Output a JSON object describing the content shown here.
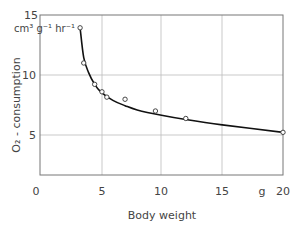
{
  "chart_data": {
    "type": "line",
    "title": "",
    "xlabel": "Body weight",
    "x_unit": "g",
    "ylabel": "O2 - consumption",
    "y_unit": "cm3 g-1 hr-1",
    "xlim": [
      0,
      20
    ],
    "ylim": [
      0,
      15
    ],
    "x_ticks": [
      0,
      5,
      10,
      15,
      20
    ],
    "y_ticks": [
      5,
      10,
      15
    ],
    "grid": true,
    "legend": null,
    "series": [
      {
        "name": "observed",
        "style": "open-circle markers",
        "x": [
          3.3,
          3.6,
          4.5,
          5.1,
          5.5,
          7.0,
          9.5,
          12.0,
          20.0
        ],
        "y": [
          13.8,
          10.5,
          8.5,
          7.8,
          7.3,
          7.1,
          6.0,
          5.3,
          4.0
        ]
      },
      {
        "name": "fitted curve",
        "style": "solid line",
        "x": [
          3.3,
          3.6,
          4.0,
          4.5,
          5.0,
          6.0,
          7.0,
          8.0,
          10.0,
          12.0,
          15.0,
          20.0
        ],
        "y": [
          13.8,
          11.0,
          9.6,
          8.5,
          7.8,
          7.0,
          6.5,
          6.1,
          5.6,
          5.2,
          4.7,
          4.0
        ]
      }
    ]
  },
  "labels": {
    "y_unit_line": "cm³ g⁻¹ hr⁻¹",
    "y_axis_title": "O₂ - consumption",
    "x_axis_title": "Body weight",
    "x_unit": "g",
    "x_tick_0": "0",
    "x_tick_5": "5",
    "x_tick_10": "10",
    "x_tick_15": "15",
    "x_tick_20": "20",
    "y_tick_5": "5",
    "y_tick_10": "10",
    "y_tick_15": "15"
  }
}
